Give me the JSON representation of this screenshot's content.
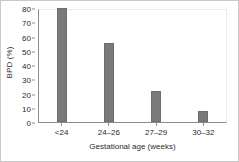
{
  "chart_data": {
    "type": "bar",
    "title": "",
    "xlabel": "Gestational age (weeks)",
    "ylabel": "BPD (%)",
    "categories": [
      "<24",
      "24–26",
      "27–29",
      "30–32"
    ],
    "values": [
      80,
      55.5,
      21.5,
      8
    ],
    "ylim": [
      0,
      80
    ],
    "yticks": [
      0,
      10,
      20,
      30,
      40,
      50,
      60,
      70,
      80
    ],
    "ytick_labels": [
      "0",
      "10",
      "20",
      "30",
      "40",
      "50",
      "60",
      "70",
      "80"
    ],
    "grid": false,
    "legend": null,
    "series": [
      {
        "name": "BPD (%)",
        "values": [
          80,
          55.5,
          21.5,
          8
        ]
      }
    ],
    "colors": {
      "bar": "#7a7a7a",
      "bar_edge": "#6d6d6d",
      "axis": "#8c8c8c",
      "text": "#2b2b2b",
      "frame": "#c9c9c9",
      "background": "#ffffff"
    }
  }
}
